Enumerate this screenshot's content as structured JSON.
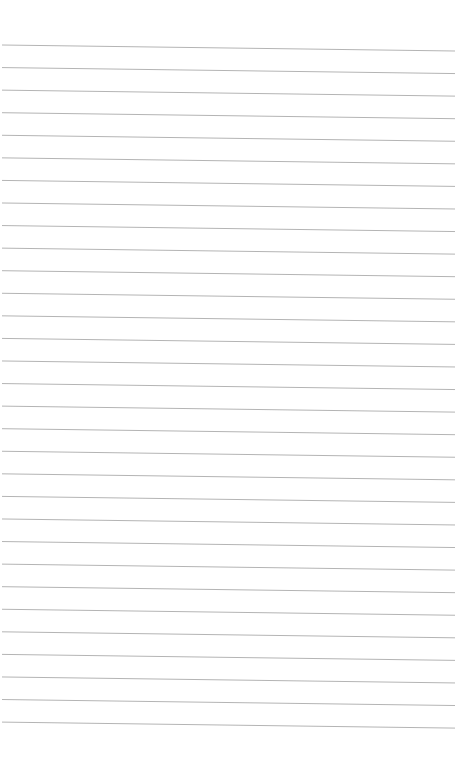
{
  "page": {
    "type": "lined-paper",
    "background_color": "#ffffff",
    "line_color": "#b4b4b4",
    "line_count": 31,
    "first_line_y_left": 45,
    "first_line_y_right": 51,
    "line_spacing": 22.57,
    "line_x_start": 2,
    "line_x_end": 455
  }
}
